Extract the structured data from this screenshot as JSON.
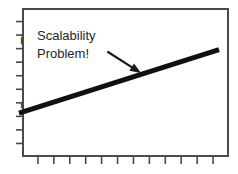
{
  "figure": {
    "background_color": "#ffffff",
    "frame_color": "#4a4a4a",
    "line_color": "#111111",
    "text_color": "#262626"
  },
  "axes": {
    "ylabel": "Response Time",
    "xlabel": "",
    "x_tick_labels": [],
    "y_tick_labels": [],
    "x_tick_count": 12,
    "y_tick_count": 10,
    "grid": "off"
  },
  "annotations": {
    "callout_line1": "Scalability",
    "callout_line2": "Problem!",
    "arrow": {
      "from_x": 108,
      "from_y": 52,
      "to_x": 141,
      "to_y": 73
    }
  },
  "chart_data": {
    "type": "line",
    "title": "",
    "xlabel": "",
    "ylabel": "Response Time",
    "grid": "off",
    "legend": "none",
    "xlim": [
      0,
      12
    ],
    "ylim": [
      0,
      10
    ],
    "x_tick_labels": [],
    "y_tick_labels": [],
    "series": [
      {
        "name": "Response Time",
        "x": [
          0,
          12
        ],
        "values": [
          2.95,
          7.2
        ],
        "description": "Single straight line rising steadily from left to right"
      }
    ],
    "annotations": [
      {
        "text": "Scalability Problem!",
        "x": 1.1,
        "y": 8.6,
        "arrow_to_x": 6.9,
        "arrow_to_y": 5.6
      }
    ]
  }
}
